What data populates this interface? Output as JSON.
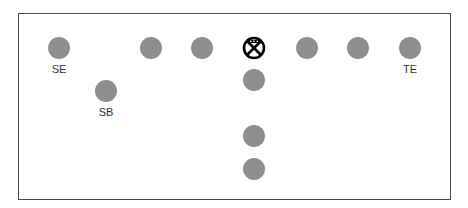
{
  "diagram": {
    "type": "football-formation",
    "colors": {
      "player": "#8e8e8e",
      "border": "#4a4a4a",
      "center_symbol": "#000000"
    },
    "center": {
      "x": 254,
      "y": 48,
      "symbol": "center-x-circle"
    },
    "players": [
      {
        "x": 59,
        "y": 48,
        "label": "SE"
      },
      {
        "x": 106,
        "y": 91,
        "label": "SB"
      },
      {
        "x": 151,
        "y": 48,
        "label": ""
      },
      {
        "x": 202,
        "y": 48,
        "label": ""
      },
      {
        "x": 307,
        "y": 48,
        "label": ""
      },
      {
        "x": 358,
        "y": 48,
        "label": ""
      },
      {
        "x": 410,
        "y": 48,
        "label": "TE"
      },
      {
        "x": 254,
        "y": 80,
        "label": ""
      },
      {
        "x": 254,
        "y": 136,
        "label": ""
      },
      {
        "x": 254,
        "y": 169,
        "label": ""
      }
    ],
    "labels": {
      "se": "SE",
      "sb": "SB",
      "te": "TE"
    }
  }
}
